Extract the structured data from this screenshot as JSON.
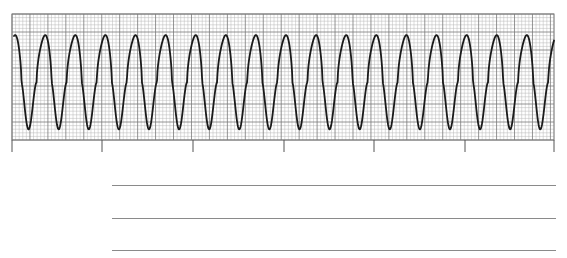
{
  "figure": {
    "type": "ecg-rhythm-strip",
    "paper": {
      "background": "#ffffff",
      "minor_grid_color": "#b8b8b8",
      "major_grid_color": "#7a7a7a",
      "trace_color": "#1a1a1a",
      "grid_left": 12,
      "grid_top": 14,
      "grid_right": 554,
      "grid_bottom": 140,
      "minor_px": 3.6,
      "major_every": 5
    },
    "tick_marks_x": [
      12,
      102,
      193,
      284,
      374,
      465,
      554
    ],
    "tick_length": 12,
    "waveform": {
      "description": "Regular wide sinusoidal complexes",
      "complex_count": 18,
      "first_peak_x": 14,
      "period_px": 30.1,
      "peak_y": 36,
      "trough_y": 129
    }
  },
  "answer_lines": [
    {
      "x1": 112,
      "x2": 556,
      "y": 185
    },
    {
      "x1": 112,
      "x2": 556,
      "y": 218
    },
    {
      "x1": 112,
      "x2": 556,
      "y": 250
    }
  ]
}
